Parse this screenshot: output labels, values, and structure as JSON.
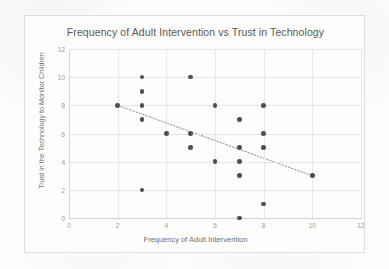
{
  "chart_data": {
    "type": "scatter",
    "title": "Frequency of Adult Intervention vs Trust in Technology",
    "xlabel": "Frequency of Adult Intervention",
    "ylabel": "Trust in the Technology to Monitor Children",
    "xlim": [
      0,
      12
    ],
    "ylim": [
      0,
      12
    ],
    "xticks": [
      0,
      2,
      4,
      6,
      8,
      10,
      12
    ],
    "yticks": [
      0,
      2,
      4,
      6,
      8,
      10,
      12
    ],
    "grid": "both",
    "legend": "none",
    "marker_color": "#4d4d53",
    "trendline_color": "#9a9a9a",
    "trendline_style": "dotted",
    "points": [
      {
        "x": 2,
        "y": 8
      },
      {
        "x": 3,
        "y": 10
      },
      {
        "x": 3,
        "y": 9
      },
      {
        "x": 3,
        "y": 8
      },
      {
        "x": 3,
        "y": 7
      },
      {
        "x": 3,
        "y": 2
      },
      {
        "x": 4,
        "y": 6
      },
      {
        "x": 5,
        "y": 10
      },
      {
        "x": 5,
        "y": 6
      },
      {
        "x": 5,
        "y": 5
      },
      {
        "x": 6,
        "y": 8
      },
      {
        "x": 6,
        "y": 4
      },
      {
        "x": 7,
        "y": 7
      },
      {
        "x": 7,
        "y": 5
      },
      {
        "x": 7,
        "y": 4
      },
      {
        "x": 7,
        "y": 3
      },
      {
        "x": 7,
        "y": 0
      },
      {
        "x": 8,
        "y": 8
      },
      {
        "x": 8,
        "y": 6
      },
      {
        "x": 8,
        "y": 5
      },
      {
        "x": 8,
        "y": 1
      },
      {
        "x": 10,
        "y": 3
      }
    ],
    "trendline": {
      "x0": 2,
      "y0": 8,
      "x1": 10,
      "y1": 3
    }
  }
}
